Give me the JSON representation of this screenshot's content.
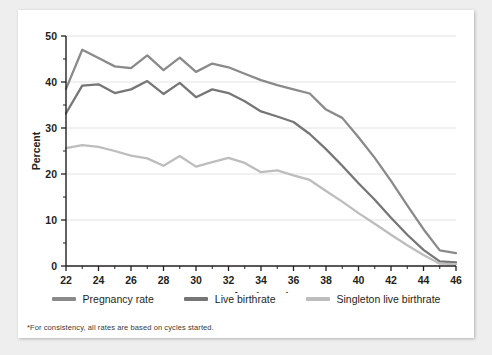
{
  "footnote": "*For consistency, all rates are based on cycles started.",
  "legend": [
    {
      "label": "Pregnancy rate",
      "color": "#8a8a8a"
    },
    {
      "label": "Live birthrate",
      "color": "#767676"
    },
    {
      "label": "Singleton live birthrate",
      "color": "#bdbdbd"
    }
  ],
  "chart_data": {
    "type": "line",
    "title": "",
    "xlabel": "Age (years)",
    "ylabel": "Percent",
    "xlim": [
      22,
      46
    ],
    "ylim": [
      0,
      50
    ],
    "xticks": [
      22,
      24,
      26,
      28,
      30,
      32,
      34,
      36,
      38,
      40,
      42,
      44,
      46
    ],
    "yticks": [
      0,
      10,
      20,
      30,
      40,
      50
    ],
    "xminor_step": 1,
    "grid": "horizontal",
    "legend_position": "below",
    "x": [
      22,
      23,
      24,
      25,
      26,
      27,
      28,
      29,
      30,
      31,
      32,
      33,
      34,
      35,
      36,
      37,
      38,
      39,
      40,
      41,
      42,
      43,
      44,
      45,
      46
    ],
    "series": [
      {
        "name": "Pregnancy rate",
        "color": "#8a8a8a",
        "values": [
          38.5,
          47.0,
          45.2,
          43.4,
          43.0,
          45.8,
          42.6,
          45.3,
          42.2,
          44.0,
          43.2,
          41.8,
          40.4,
          39.3,
          38.4,
          37.5,
          34.0,
          32.2,
          28.0,
          23.5,
          18.5,
          13.2,
          8.0,
          3.4,
          2.8
        ]
      },
      {
        "name": "Live birthrate",
        "color": "#767676",
        "values": [
          33.2,
          39.2,
          39.5,
          37.6,
          38.4,
          40.2,
          37.4,
          39.8,
          36.7,
          38.4,
          37.6,
          35.8,
          33.6,
          32.5,
          31.3,
          28.7,
          25.4,
          21.8,
          18.0,
          14.4,
          10.5,
          6.8,
          3.5,
          1.0,
          0.8
        ]
      },
      {
        "name": "Singleton live birthrate",
        "color": "#bdbdbd",
        "values": [
          25.6,
          26.3,
          25.9,
          25.0,
          24.0,
          23.4,
          21.8,
          23.9,
          21.6,
          22.6,
          23.5,
          22.4,
          20.4,
          20.8,
          19.7,
          18.7,
          16.3,
          14.0,
          11.5,
          9.2,
          6.8,
          4.5,
          2.4,
          0.5,
          0.4
        ]
      }
    ]
  }
}
